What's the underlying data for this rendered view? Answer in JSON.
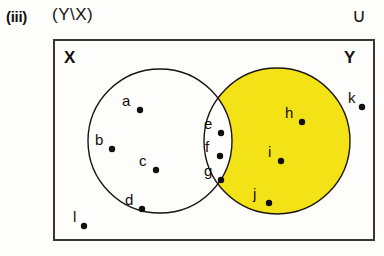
{
  "header": {
    "roman_label": "(iii)",
    "expression": "(Y\\X)",
    "universal_symbol": "∪"
  },
  "diagram": {
    "title": "(Y\\X)",
    "set_x_label": "X",
    "set_y_label": "Y",
    "shaded_region": "Y\\X",
    "colors": {
      "shaded_fill": "#F2E216",
      "unshaded_fill": "#FFFFFF",
      "outline": "#1a1512",
      "box_border": "#3b3633",
      "background": "#fdfdfb"
    },
    "universe_box": {
      "x": 54,
      "y": 40,
      "width": 320,
      "height": 200
    },
    "circle_x": {
      "cx": 160,
      "cy": 141,
      "r": 72,
      "filled": false
    },
    "circle_y": {
      "cx": 277,
      "cy": 141,
      "r": 73,
      "filled": true
    },
    "elements": [
      {
        "label": "a",
        "region": "X-only",
        "lx": 122,
        "ly": 106,
        "dx": 140,
        "dy": 110
      },
      {
        "label": "b",
        "region": "X-only",
        "lx": 95,
        "ly": 145,
        "dx": 112,
        "dy": 149
      },
      {
        "label": "c",
        "region": "X-only",
        "lx": 139,
        "ly": 166,
        "dx": 156,
        "dy": 170
      },
      {
        "label": "d",
        "region": "X-only",
        "lx": 125,
        "ly": 205,
        "dx": 142,
        "dy": 209
      },
      {
        "label": "e",
        "region": "intersection",
        "lx": 204,
        "ly": 129,
        "dx": 221,
        "dy": 133
      },
      {
        "label": "f",
        "region": "intersection",
        "lx": 205,
        "ly": 152,
        "dx": 220,
        "dy": 156
      },
      {
        "label": "g",
        "region": "intersection",
        "lx": 204,
        "ly": 176,
        "dx": 221,
        "dy": 180
      },
      {
        "label": "h",
        "region": "Y-only",
        "lx": 285,
        "ly": 118,
        "dx": 302,
        "dy": 122
      },
      {
        "label": "i",
        "region": "Y-only",
        "lx": 268,
        "ly": 157,
        "dx": 281,
        "dy": 161
      },
      {
        "label": "j",
        "region": "Y-only",
        "lx": 253,
        "ly": 199,
        "dx": 269,
        "dy": 203
      },
      {
        "label": "k",
        "region": "outside",
        "lx": 348,
        "ly": 103,
        "dx": 362,
        "dy": 107
      },
      {
        "label": "l",
        "region": "outside",
        "lx": 73,
        "ly": 222,
        "dx": 84,
        "dy": 226
      }
    ]
  }
}
